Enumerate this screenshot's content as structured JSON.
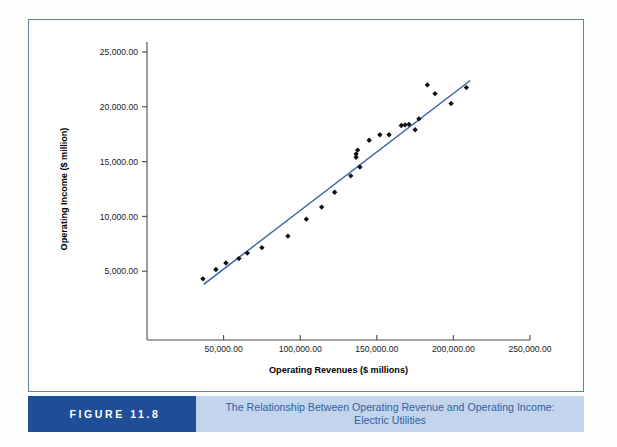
{
  "figure": {
    "tag_label": "FIGURE 11.8",
    "caption_line1": "The Relationship Between Operating Revenue and Operating Income:",
    "caption_line2": "Electric Utilities",
    "tag_bg_color": "#1f4e96",
    "caption_bg_color": "#c3d5ec",
    "caption_text_color": "#2f5fa4",
    "frame_border_color": "#5b7fb4"
  },
  "chart_data": {
    "type": "scatter",
    "title": "",
    "xlabel": "Operating Revenues ($ millions)",
    "ylabel": "Operating Income ($ million)",
    "xlim": [
      0,
      250000
    ],
    "ylim": [
      0,
      25000
    ],
    "xticks": [
      50000,
      100000,
      150000,
      200000,
      250000
    ],
    "yticks": [
      5000,
      10000,
      15000,
      20000,
      25000
    ],
    "xtick_labels": [
      "50,000.00",
      "100,000.00",
      "150,000.00",
      "200,000.00",
      "250,000.00"
    ],
    "ytick_labels": [
      "5,000.00",
      "10,000.00",
      "15,000.00",
      "20,000.00",
      "25,000.00"
    ],
    "grid": false,
    "legend": null,
    "marker": "diamond",
    "marker_color": "#111111",
    "trendline": {
      "color": "#3a62a8",
      "x": [
        37000,
        211000
      ],
      "y": [
        3800,
        22400
      ]
    },
    "points": [
      {
        "x": 36500,
        "y": 4300
      },
      {
        "x": 45000,
        "y": 5150
      },
      {
        "x": 51500,
        "y": 5750
      },
      {
        "x": 60000,
        "y": 6150
      },
      {
        "x": 65500,
        "y": 6650
      },
      {
        "x": 75000,
        "y": 7150
      },
      {
        "x": 92000,
        "y": 8200
      },
      {
        "x": 104000,
        "y": 9750
      },
      {
        "x": 114000,
        "y": 10850
      },
      {
        "x": 122500,
        "y": 12200
      },
      {
        "x": 133000,
        "y": 13700
      },
      {
        "x": 139000,
        "y": 14500
      },
      {
        "x": 136500,
        "y": 15400
      },
      {
        "x": 136500,
        "y": 15700
      },
      {
        "x": 137500,
        "y": 16050
      },
      {
        "x": 145000,
        "y": 16950
      },
      {
        "x": 152000,
        "y": 17450
      },
      {
        "x": 158000,
        "y": 17450
      },
      {
        "x": 166000,
        "y": 18300
      },
      {
        "x": 168500,
        "y": 18350
      },
      {
        "x": 171000,
        "y": 18400
      },
      {
        "x": 175000,
        "y": 17900
      },
      {
        "x": 177500,
        "y": 18900
      },
      {
        "x": 183000,
        "y": 22000
      },
      {
        "x": 188000,
        "y": 21200
      },
      {
        "x": 198500,
        "y": 20300
      },
      {
        "x": 208500,
        "y": 21750
      }
    ]
  }
}
